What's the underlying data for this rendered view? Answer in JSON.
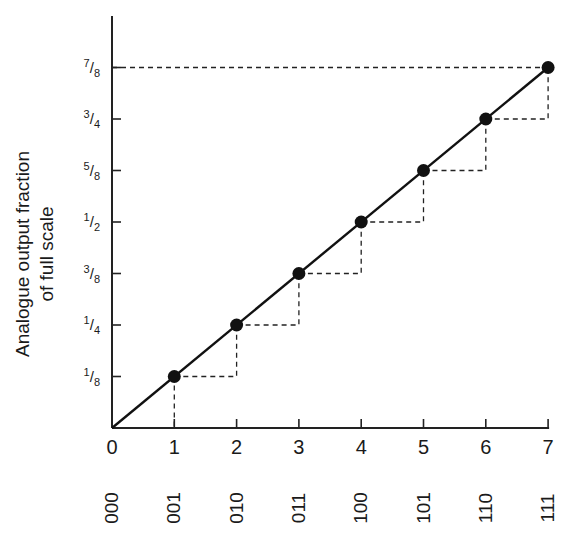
{
  "chart_data": {
    "type": "line",
    "title": "",
    "ylabel": "Analogue output fraction of full scale",
    "ylabel_lines": [
      "Analogue output fraction",
      "of full scale"
    ],
    "xlabel": "",
    "x": [
      0,
      1,
      2,
      3,
      4,
      5,
      6,
      7
    ],
    "x_tick_labels": [
      "0",
      "1",
      "2",
      "3",
      "4",
      "5",
      "6",
      "7"
    ],
    "binary_codes": [
      "000",
      "001",
      "010",
      "011",
      "100",
      "101",
      "110",
      "111"
    ],
    "y_tick_labels": [
      {
        "num": "1",
        "den": "8",
        "value": 0.125
      },
      {
        "num": "1",
        "den": "4",
        "value": 0.25
      },
      {
        "num": "3",
        "den": "8",
        "value": 0.375
      },
      {
        "num": "1",
        "den": "2",
        "value": 0.5
      },
      {
        "num": "5",
        "den": "8",
        "value": 0.625
      },
      {
        "num": "3",
        "den": "4",
        "value": 0.75
      },
      {
        "num": "7",
        "den": "8",
        "value": 0.875
      }
    ],
    "series": [
      {
        "name": "DAC output",
        "values": [
          0,
          0.125,
          0.25,
          0.375,
          0.5,
          0.625,
          0.75,
          0.875
        ],
        "markers": "filled-circle",
        "line": "solid"
      }
    ],
    "annotations": "Dashed staircase steps between successive points; dashed horizontal reference line at 7/8 to y-axis; dashed vertical drop from point 1 to x-axis",
    "xlim": [
      0,
      7
    ],
    "ylim": [
      0,
      1
    ],
    "grid": false,
    "legend": "none"
  }
}
